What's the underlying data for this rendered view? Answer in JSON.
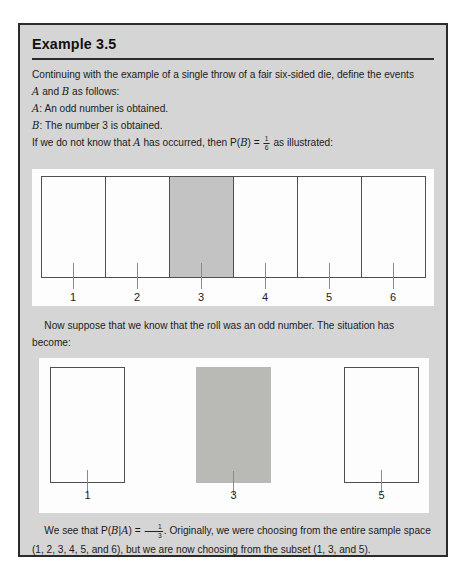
{
  "colors": {
    "box_background": "#d5d5d5",
    "box_border": "#2b2b2b",
    "panel_background": "#fdfdfd",
    "shaded_cell": "#c3c3c3",
    "shaded_rect": "#b9bab6",
    "cell_border": "#4f4f4f",
    "text": "#1b1b1b"
  },
  "header": {
    "title": "Example 3.5"
  },
  "intro": {
    "line1": "Continuing with the example of a single throw of a fair six-sided die, define the events",
    "line2": {
      "var_a": "A",
      "mid": " and ",
      "var_b": "B",
      "end": " as follows:"
    },
    "def_a": {
      "var": "A",
      "text": ": An odd number is obtained."
    },
    "def_b": {
      "var": "B",
      "text": ": The number 3 is obtained."
    },
    "line5": {
      "pre": "If we do not know that ",
      "var_a": "A",
      "mid": " has occurred, then P(",
      "var_b": "B",
      "close": ") = ",
      "frac_num": "1",
      "frac_den": "6",
      "end": " as illustrated:"
    }
  },
  "diagram1": {
    "labels": [
      "1",
      "2",
      "3",
      "4",
      "5",
      "6"
    ],
    "shaded_label": "3"
  },
  "middle": {
    "line1": "Now suppose that we know that the roll was an odd number. The situation has",
    "line2": "become:"
  },
  "diagram2": {
    "labels": [
      "1",
      "3",
      "5"
    ],
    "shaded_label": "3"
  },
  "conclusion": {
    "line1": {
      "pre": "We see that P(",
      "var_b": "B",
      "bar": "|",
      "var_a": "A",
      "close": ") = ",
      "frac_num": "1",
      "frac_den": "3",
      "end": ". Originally, we were choosing from the entire sample space"
    },
    "line2": "(1, 2, 3, 4, 5, and 6), but we are now choosing from the subset (1, 3, and 5)."
  }
}
